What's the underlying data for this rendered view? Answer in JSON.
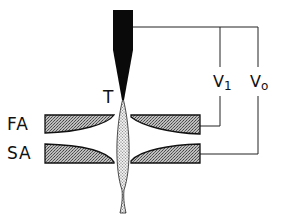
{
  "diagram": {
    "type": "field-emission electron gun schematic",
    "labels": {
      "tip": "T",
      "first_anode": "FA",
      "second_anode": "SA",
      "v1_main": "V",
      "v1_sub": "1",
      "v0_main": "V",
      "v0_sub": "o"
    },
    "components": [
      {
        "id": "tip",
        "label": "T",
        "description": "sharp emitter tip (black)"
      },
      {
        "id": "first-anode",
        "label": "FA",
        "description": "first anode electrode pair"
      },
      {
        "id": "second-anode",
        "label": "SA",
        "description": "second anode electrode pair"
      },
      {
        "id": "electron-beam",
        "label": "",
        "description": "dotted beam converging through anodes"
      },
      {
        "id": "v1-supply",
        "label": "V1",
        "connects": [
          "tip",
          "first-anode"
        ]
      },
      {
        "id": "v0-supply",
        "label": "Vo",
        "connects": [
          "tip",
          "second-anode"
        ]
      }
    ],
    "colors": {
      "ink": "#111111",
      "hatch_fill": "#9a9a9a",
      "background": "#ffffff"
    }
  }
}
